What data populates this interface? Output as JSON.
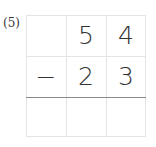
{
  "problem": {
    "label": "(5)",
    "rows": [
      [
        "",
        "5",
        "4"
      ],
      [
        "−",
        "2",
        "3"
      ],
      [
        "",
        "",
        ""
      ]
    ]
  }
}
